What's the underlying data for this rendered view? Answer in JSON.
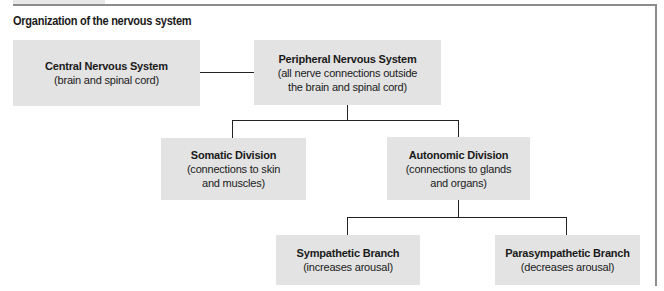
{
  "title": "Organization of the nervous system",
  "nodes": {
    "cns": {
      "name": "Central Nervous System",
      "desc": [
        "(brain and spinal cord)"
      ]
    },
    "pns": {
      "name": "Peripheral Nervous System",
      "desc": [
        "(all nerve connections outside",
        "the brain and spinal cord)"
      ]
    },
    "somatic": {
      "name": "Somatic Division",
      "desc": [
        "(connections to skin",
        "and muscles)"
      ]
    },
    "autonomic": {
      "name": "Autonomic Division",
      "desc": [
        "(connections to glands",
        "and organs)"
      ]
    },
    "sympathetic": {
      "name": "Sympathetic Branch",
      "desc": [
        "(increases arousal)"
      ]
    },
    "parasympathetic": {
      "name": "Parasympathetic Branch",
      "desc": [
        "(decreases arousal)"
      ]
    }
  },
  "edges": [
    [
      "cns",
      "pns"
    ],
    [
      "pns",
      "somatic"
    ],
    [
      "pns",
      "autonomic"
    ],
    [
      "autonomic",
      "sympathetic"
    ],
    [
      "autonomic",
      "parasympathetic"
    ]
  ],
  "colors": {
    "box": "#e3e3e3",
    "line": "#222222",
    "frame": "#8c8c8c"
  }
}
